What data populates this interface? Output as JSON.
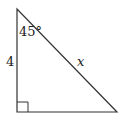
{
  "diagram": {
    "type": "right-triangle",
    "labels": {
      "angle": "45°",
      "vertical_side": "4",
      "hypotenuse": "x"
    },
    "right_angle_marker": true,
    "stroke_color": "#333333"
  }
}
